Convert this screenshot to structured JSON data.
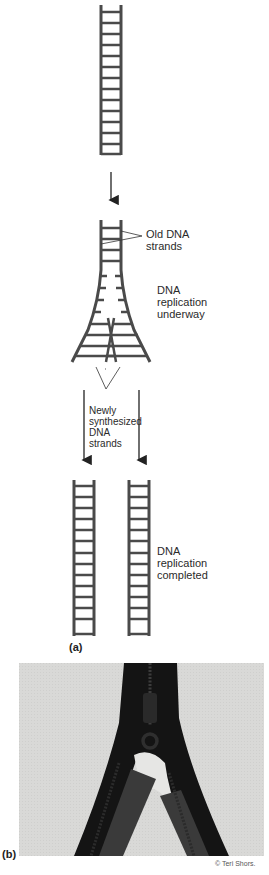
{
  "figure": {
    "panel_a": {
      "label": "(a)",
      "annotations": {
        "old_strands": [
          "Old DNA",
          "strands"
        ],
        "underway": [
          "DNA",
          "replication",
          "underway"
        ],
        "new_strands": [
          "Newly",
          "synthesized",
          "DNA",
          "strands"
        ],
        "completed": [
          "DNA",
          "replication",
          "completed"
        ]
      }
    },
    "panel_b": {
      "label": "(b)",
      "photo_description": "Photograph of an unzipping zipper illustrating DNA replication fork",
      "credit": "© Teri Shors."
    },
    "colors": {
      "ladder": "#4a4a4a",
      "text": "#2a2a2a",
      "photo_bg": "#d8d8d6",
      "zipper": "#141414",
      "zipper_tape": "#3a3a3a"
    }
  }
}
